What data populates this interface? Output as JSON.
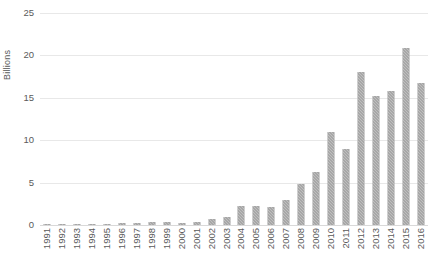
{
  "chart_data": {
    "type": "bar",
    "title": "",
    "subtitle": "",
    "xlabel": "",
    "ylabel": "Billions",
    "ylim": [
      0,
      25
    ],
    "yticks": [
      0,
      5,
      10,
      15,
      20,
      25
    ],
    "ytick_labels": [
      "0",
      "5",
      "10",
      "15",
      "20",
      "25"
    ],
    "grid": true,
    "legend": false,
    "legend_position": "none",
    "bar_color": "#909090",
    "gridline_color": "#e8e8e8",
    "axis_text_color": "#5a5a5a",
    "categories": [
      "1991",
      "1992",
      "1993",
      "1994",
      "1995",
      "1996",
      "1997",
      "1998",
      "1999",
      "2000",
      "2001",
      "2002",
      "2003",
      "2004",
      "2005",
      "2006",
      "2007",
      "2008",
      "2009",
      "2010",
      "2011",
      "2012",
      "2013",
      "2014",
      "2015",
      "2016"
    ],
    "values": [
      0.1,
      0.12,
      0.06,
      0.06,
      0.15,
      0.18,
      0.2,
      0.4,
      0.4,
      0.25,
      0.35,
      0.75,
      1.0,
      2.3,
      2.3,
      2.1,
      3.0,
      4.8,
      6.2,
      11.0,
      9.0,
      18.1,
      15.2,
      15.8,
      20.9,
      16.7
    ]
  }
}
